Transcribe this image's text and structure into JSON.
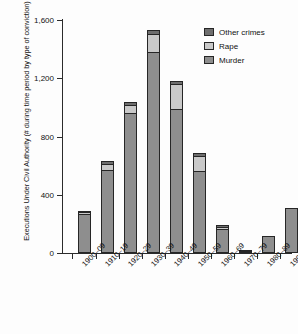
{
  "chart_data": {
    "type": "bar",
    "title": "",
    "subtitle": "",
    "xlabel": "",
    "ylabel": "Executions Under Civil Authority (# during time period by type of conviction)",
    "ylim": [
      0,
      1600
    ],
    "yticks": [
      0,
      400,
      800,
      1200,
      1600
    ],
    "ytick_labels": [
      "0",
      "400",
      "800",
      "1,200",
      "1,600"
    ],
    "grid": false,
    "stacked": true,
    "legend_position": "top-right",
    "categories": [
      "1900–09",
      "1910–19",
      "1920–29",
      "1930–39",
      "1940–49",
      "1950–59",
      "1960–69",
      "1970–79",
      "1980–89",
      "1990–98"
    ],
    "series": [
      {
        "name": "Murder",
        "color": "#8e8e8e",
        "values": [
          268,
          572,
          961,
          1381,
          987,
          565,
          166,
          12,
          117,
          306
        ]
      },
      {
        "name": "Rape",
        "color": "#c9c9c9",
        "values": [
          14,
          42,
          57,
          123,
          176,
          102,
          16,
          0,
          0,
          0
        ]
      },
      {
        "name": "Other crimes",
        "color": "#6e6e6e",
        "values": [
          10,
          19,
          17,
          28,
          21,
          20,
          8,
          3,
          0,
          0
        ]
      }
    ],
    "totals": [
      292,
      633,
      1035,
      1532,
      1184,
      687,
      190,
      15,
      117,
      306
    ]
  },
  "legend": {
    "items": [
      {
        "label": "Other crimes",
        "color": "#6e6e6e"
      },
      {
        "label": "Rape",
        "color": "#c9c9c9"
      },
      {
        "label": "Murder",
        "color": "#8e8e8e"
      }
    ]
  },
  "axes": {
    "y_title": "Executions Under Civil Authority (# during time period by type of conviction)"
  }
}
